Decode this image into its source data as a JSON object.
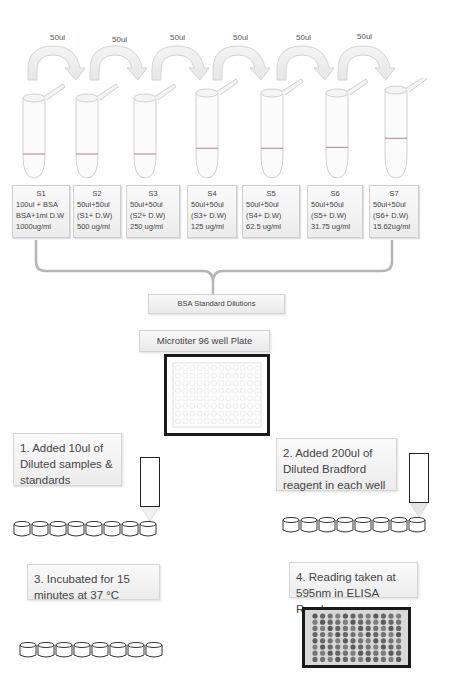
{
  "transfer_volumes": [
    "50ul",
    "50ul",
    "50ul",
    "50ul",
    "50ul",
    "50ul"
  ],
  "tube_fill_levels": [
    0.7,
    0.7,
    0.7,
    0.65,
    0.65,
    0.64,
    0.55
  ],
  "samples": [
    {
      "id": "S1",
      "line1": "100ul + BSA",
      "line2": "BSA+1ml D.W",
      "line3": "1000ug/ml"
    },
    {
      "id": "S2",
      "line1": "50ul+50ul",
      "line2": "(S1+ D.W)",
      "line3": "500 ug/ml"
    },
    {
      "id": "S3",
      "line1": "50ul+50ul",
      "line2": "(S2+ D.W)",
      "line3": "250 ug/ml"
    },
    {
      "id": "S4",
      "line1": "50ul+50ul",
      "line2": "(S3+ D.W)",
      "line3": "125 ug/ml"
    },
    {
      "id": "S5",
      "line1": "50ul+50ul",
      "line2": "(S4+ D.W)",
      "line3": "62.5 ug/ml"
    },
    {
      "id": "S6",
      "line1": "50ul+50ul",
      "line2": "(S5+ D.W)",
      "line3": "31.75 ug/ml"
    },
    {
      "id": "S7",
      "line1": "50ul+50ul",
      "line2": "(S6+ D.W)",
      "line3": "15.62ug/ml"
    }
  ],
  "bsa_label": "BSA Standard Dilutions",
  "plate_label": "Microtiter 96 well Plate",
  "steps": {
    "step1": "1. Added 10ul of Diluted samples & standards",
    "step2": "2. Added 200ul of Diluted Bradford reagent in each well",
    "step3": "3. Incubated for 15 minutes at 37 °C",
    "step4": "4. Reading taken at 595nm in ELISA Reader"
  },
  "colors": {
    "box_border": "#cfcfcf",
    "plate_border": "#1a1a1a",
    "tube_line": "#d0d0d0",
    "fill_line": "#b89a9a",
    "well_dark": "#6a6a6a"
  }
}
